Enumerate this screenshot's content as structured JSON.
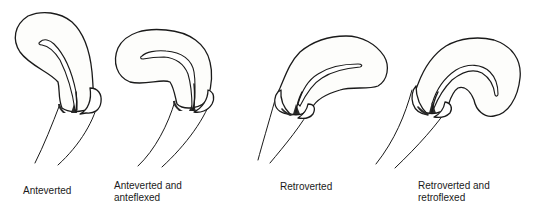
{
  "diagram": {
    "type": "anatomical-illustration",
    "panels": [
      {
        "id": "anteverted",
        "label_line1": "Anteverted",
        "label_line2": ""
      },
      {
        "id": "anteverted-anteflexed",
        "label_line1": "Anteverted and",
        "label_line2": "anteflexed"
      },
      {
        "id": "retroverted",
        "label_line1": "Retroverted",
        "label_line2": ""
      },
      {
        "id": "retroverted-retroflexed",
        "label_line1": "Retroverted and",
        "label_line2": "retroflexed"
      }
    ],
    "colors": {
      "line": "#1a1a1a",
      "background": "#ffffff"
    }
  }
}
